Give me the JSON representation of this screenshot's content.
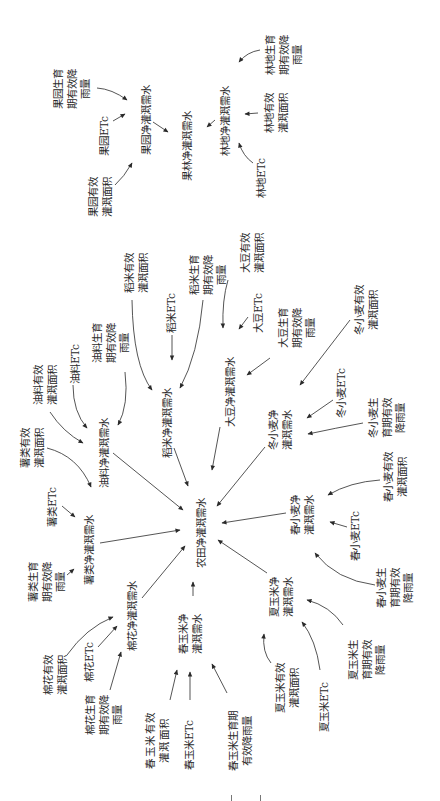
{
  "nodes": {
    "farm_net": "农田净灌溉需水",
    "fruit_forest_net": "果林净灌溉需水",
    "orchard": {
      "net": "果园净灌溉需水",
      "etc": "果园ETc",
      "area": "果园有效\n灌溉面积",
      "rainfall": "果园生育\n期有效降\n雨量"
    },
    "forest": {
      "net": "林地净灌溉需水",
      "etc": "林地ETc",
      "area": "林地有效\n灌溉面积",
      "rainfall": "林地生育\n期有效降\n雨量"
    },
    "rice": {
      "net": "稻米净灌溉需水",
      "etc": "稻米ETc",
      "area": "稻米有效\n灌溉面积",
      "rainfall": "稻米生育\n期有效降\n雨量"
    },
    "soybean": {
      "net": "大豆净灌溉需水",
      "etc": "大豆ETc",
      "area": "大豆有效\n灌溉面积",
      "rainfall": "大豆生育\n期有效降\n雨量"
    },
    "oil": {
      "net": "油料净灌溉需水",
      "etc": "油料ETc",
      "area": "油料有效\n灌溉面积",
      "rainfall": "油料生育\n期有效降\n雨量"
    },
    "potato": {
      "net": "薯类净灌溉需水",
      "etc": "薯类ETc",
      "area": "薯类有效\n灌溉面积",
      "rainfall": "薯类生育\n期有效降\n雨量"
    },
    "cotton": {
      "net": "棉花净灌溉需水",
      "etc": "棉花ETc",
      "area": "棉花有效\n灌溉面积",
      "rainfall": "棉花生育\n期有效降\n雨量"
    },
    "spring_maize": {
      "net": "春玉米净\n灌溉需水",
      "etc": "春玉米ETc",
      "area": "春玉米有效\n灌溉面积",
      "rainfall": "春玉米生育期\n有效降雨量"
    },
    "summer_maize": {
      "net": "夏玉米净\n灌溉需水",
      "etc": "夏玉米ETc",
      "area": "夏玉米有效\n灌溉面积",
      "rainfall": "夏玉米生\n育期有效\n降雨量"
    },
    "spring_wheat": {
      "net": "春小麦净\n灌溉需水",
      "etc": "春小麦ETc",
      "area": "春小麦有效\n灌溉面积",
      "rainfall": "春小麦生\n育期有效\n降雨量"
    },
    "winter_wheat": {
      "net": "冬小麦净\n灌溉需水",
      "etc": "冬小麦ETc",
      "area": "冬小麦有效\n灌溉面积",
      "rainfall": "冬小麦生\n育期有效\n降雨量"
    }
  },
  "edges": [
    {
      "from": "果园生育期有效降雨量",
      "to": "果园净灌溉需水"
    },
    {
      "from": "果园ETc",
      "to": "果园净灌溉需水"
    },
    {
      "from": "果园有效灌溉面积",
      "to": "果园净灌溉需水"
    },
    {
      "from": "果园净灌溉需水",
      "to": "果林净灌溉需水"
    },
    {
      "from": "林地净灌溉需水",
      "to": "果林净灌溉需水"
    },
    {
      "from": "林地生育期有效降雨量",
      "to": "林地净灌溉需水"
    },
    {
      "from": "林地有效灌溉面积",
      "to": "林地净灌溉需水"
    },
    {
      "from": "林地ETc",
      "to": "林地净灌溉需水"
    },
    {
      "from": "稻米有效灌溉面积",
      "to": "稻米净灌溉需水"
    },
    {
      "from": "稻米ETc",
      "to": "稻米净灌溉需水"
    },
    {
      "from": "稻米生育期有效降雨量",
      "to": "稻米净灌溉需水"
    },
    {
      "from": "稻米净灌溉需水",
      "to": "农田净灌溉需水"
    },
    {
      "from": "油料生育期有效降雨量",
      "to": "油料净灌溉需水"
    },
    {
      "from": "油料ETc",
      "to": "油料净灌溉需水"
    },
    {
      "from": "油料有效灌溉面积",
      "to": "油料净灌溉需水"
    },
    {
      "from": "油料净灌溉需水",
      "to": "农田净灌溉需水"
    },
    {
      "from": "薯类有效灌溉面积",
      "to": "薯类净灌溉需水"
    },
    {
      "from": "薯类ETc",
      "to": "薯类净灌溉需水"
    },
    {
      "from": "薯类生育期有效降雨量",
      "to": "薯类净灌溉需水"
    },
    {
      "from": "薯类净灌溉需水",
      "to": "农田净灌溉需水"
    },
    {
      "from": "棉花有效灌溉面积",
      "to": "棉花净灌溉需水"
    },
    {
      "from": "棉花ETc",
      "to": "棉花净灌溉需水"
    },
    {
      "from": "棉花生育期有效降雨量",
      "to": "棉花净灌溉需水"
    },
    {
      "from": "棉花净灌溉需水",
      "to": "农田净灌溉需水"
    },
    {
      "from": "春玉米有效灌溉面积",
      "to": "春玉米净灌溉需水"
    },
    {
      "from": "春玉米ETc",
      "to": "春玉米净灌溉需水"
    },
    {
      "from": "春玉米生育期有效降雨量",
      "to": "春玉米净灌溉需水"
    },
    {
      "from": "春玉米净灌溉需水",
      "to": "农田净灌溉需水"
    },
    {
      "from": "夏玉米有效灌溉面积",
      "to": "夏玉米净灌溉需水"
    },
    {
      "from": "夏玉米ETc",
      "to": "夏玉米净灌溉需水"
    },
    {
      "from": "夏玉米生育期有效降雨量",
      "to": "夏玉米净灌溉需水"
    },
    {
      "from": "夏玉米净灌溉需水",
      "to": "农田净灌溉需水"
    },
    {
      "from": "春小麦有效灌溉面积",
      "to": "春小麦净灌溉需水"
    },
    {
      "from": "春小麦ETc",
      "to": "春小麦净灌溉需水"
    },
    {
      "from": "春小麦生育期有效降雨量",
      "to": "春小麦净灌溉需水"
    },
    {
      "from": "春小麦净灌溉需水",
      "to": "农田净灌溉需水"
    },
    {
      "from": "冬小麦有效灌溉面积",
      "to": "冬小麦净灌溉需水"
    },
    {
      "from": "冬小麦ETc",
      "to": "冬小麦净灌溉需水"
    },
    {
      "from": "冬小麦生育期有效降雨量",
      "to": "冬小麦净灌溉需水"
    },
    {
      "from": "冬小麦净灌溉需水",
      "to": "农田净灌溉需水"
    },
    {
      "from": "大豆有效灌溉面积",
      "to": "大豆净灌溉需水"
    },
    {
      "from": "大豆ETc",
      "to": "大豆净灌溉需水"
    },
    {
      "from": "大豆生育期有效降雨量",
      "to": "大豆净灌溉需水"
    },
    {
      "from": "大豆净灌溉需水",
      "to": "农田净灌溉需水"
    }
  ]
}
